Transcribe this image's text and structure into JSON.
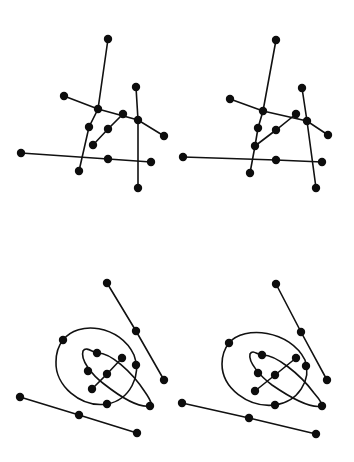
{
  "diagram": {
    "title": "",
    "colors": {
      "ink": "#111111",
      "node": "#0d0d0d",
      "background": "#ffffff"
    },
    "node_radius": 4.2,
    "panels": [
      {
        "id": "top-left",
        "nodes": [
          [
            108,
            39
          ],
          [
            79,
            171
          ],
          [
            64,
            96
          ],
          [
            98,
            109
          ],
          [
            164,
            136
          ],
          [
            136,
            87
          ],
          [
            138,
            120
          ],
          [
            138,
            188
          ],
          [
            123,
            114
          ],
          [
            108,
            129
          ],
          [
            93,
            145
          ],
          [
            89,
            127
          ],
          [
            21,
            153
          ],
          [
            108,
            159
          ],
          [
            151,
            162
          ]
        ],
        "lines": [
          [
            [
              108,
              39
            ],
            [
              98,
              109
            ],
            [
              89,
              127
            ],
            [
              79,
              171
            ]
          ],
          [
            [
              64,
              96
            ],
            [
              98,
              109
            ],
            [
              138,
              120
            ],
            [
              164,
              136
            ]
          ],
          [
            [
              136,
              87
            ],
            [
              138,
              120
            ],
            [
              138,
              188
            ]
          ],
          [
            [
              123,
              114
            ],
            [
              108,
              129
            ],
            [
              93,
              145
            ]
          ],
          [
            [
              21,
              153
            ],
            [
              108,
              159
            ],
            [
              151,
              162
            ]
          ]
        ],
        "curves": []
      },
      {
        "id": "top-right",
        "nodes": [
          [
            276,
            40
          ],
          [
            263,
            111
          ],
          [
            250,
            173
          ],
          [
            230,
            99
          ],
          [
            328,
            135
          ],
          [
            302,
            88
          ],
          [
            307,
            121
          ],
          [
            316,
            188
          ],
          [
            296,
            114
          ],
          [
            276,
            130
          ],
          [
            255,
            146
          ],
          [
            258,
            128
          ],
          [
            183,
            157
          ],
          [
            276,
            160
          ],
          [
            322,
            162
          ]
        ],
        "lines": [
          [
            [
              276,
              40
            ],
            [
              263,
              111
            ],
            [
              258,
              128
            ],
            [
              255,
              146
            ],
            [
              250,
              173
            ]
          ],
          [
            [
              230,
              99
            ],
            [
              263,
              111
            ],
            [
              307,
              121
            ],
            [
              328,
              135
            ]
          ],
          [
            [
              302,
              88
            ],
            [
              307,
              121
            ],
            [
              316,
              188
            ]
          ],
          [
            [
              296,
              114
            ],
            [
              276,
              130
            ],
            [
              255,
              146
            ]
          ],
          [
            [
              183,
              157
            ],
            [
              276,
              160
            ],
            [
              322,
              162
            ]
          ]
        ],
        "curves": []
      },
      {
        "id": "bottom-left",
        "nodes": [
          [
            107,
            283
          ],
          [
            136,
            331
          ],
          [
            164,
            380
          ],
          [
            20,
            397
          ],
          [
            79,
            415
          ],
          [
            137,
            433
          ],
          [
            63,
            340
          ],
          [
            136,
            365
          ],
          [
            107,
            404
          ],
          [
            97,
            353
          ],
          [
            88,
            371
          ],
          [
            150,
            406
          ],
          [
            122,
            358
          ],
          [
            107,
            374
          ],
          [
            92,
            389
          ]
        ],
        "lines": [
          [
            [
              107,
              283
            ],
            [
              136,
              331
            ],
            [
              164,
              380
            ]
          ],
          [
            [
              20,
              397
            ],
            [
              79,
              415
            ],
            [
              137,
              433
            ]
          ],
          [
            [
              122,
              358
            ],
            [
              107,
              374
            ],
            [
              92,
              389
            ]
          ]
        ],
        "curves": [
          "M63,340 C78,320 120,325 134,355 C142,375 130,400 107,404 C80,408 55,385 56,362 C56,352 59,345 63,340 Z",
          "M97,353 C110,352 132,372 145,392 C152,402 153,408 150,406 C138,408 118,395 104,384 C92,375 80,360 83,351 C86,346 92,352 97,353 Z"
        ]
      },
      {
        "id": "bottom-right",
        "nodes": [
          [
            276,
            284
          ],
          [
            301,
            332
          ],
          [
            327,
            380
          ],
          [
            182,
            403
          ],
          [
            249,
            418
          ],
          [
            316,
            434
          ],
          [
            229,
            343
          ],
          [
            306,
            366
          ],
          [
            275,
            405
          ],
          [
            262,
            355
          ],
          [
            258,
            373
          ],
          [
            322,
            406
          ],
          [
            296,
            358
          ],
          [
            275,
            375
          ],
          [
            255,
            391
          ]
        ],
        "lines": [
          [
            [
              276,
              284
            ],
            [
              301,
              332
            ],
            [
              327,
              380
            ]
          ],
          [
            [
              182,
              403
            ],
            [
              249,
              418
            ],
            [
              316,
              434
            ]
          ],
          [
            [
              296,
              358
            ],
            [
              275,
              375
            ],
            [
              255,
              391
            ]
          ]
        ],
        "curves": [
          "M229,343 C244,325 290,330 305,360 C312,380 298,402 275,405 C248,408 222,388 222,364 C222,355 225,348 229,343 Z",
          "M262,355 C275,354 300,374 314,393 C322,402 324,408 322,406 C310,409 288,396 272,385 C260,376 248,362 250,354 C253,349 257,355 262,355 Z"
        ]
      }
    ]
  }
}
